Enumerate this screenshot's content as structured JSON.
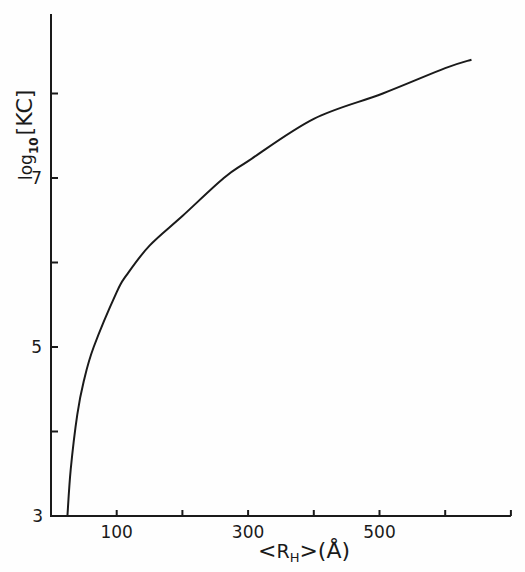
{
  "chart_data": {
    "type": "line",
    "title": "",
    "xlabel": "<R_H> (Å)",
    "ylabel": "log10 [KC]",
    "xlim": [
      0,
      700
    ],
    "ylim": [
      3,
      8.9
    ],
    "grid": false,
    "legend": null,
    "x_ticks": [
      0,
      100,
      200,
      300,
      400,
      500,
      600,
      700
    ],
    "x_tick_labels": [
      "",
      "100",
      "",
      "300",
      "",
      "500",
      "",
      ""
    ],
    "y_ticks": [
      3,
      4,
      5,
      6,
      7,
      8
    ],
    "y_tick_labels": [
      "3",
      "",
      "5",
      "",
      "7",
      ""
    ],
    "series": [
      {
        "name": "log10[KC] vs <R_H>",
        "x": [
          25,
          30,
          40,
          50,
          65,
          100,
          115,
          150,
          200,
          263,
          300,
          400,
          505,
          600,
          640
        ],
        "y": [
          3.0,
          3.55,
          4.2,
          4.6,
          5.0,
          5.65,
          5.85,
          6.2,
          6.55,
          7.0,
          7.2,
          7.7,
          8.0,
          8.3,
          8.4
        ]
      }
    ]
  },
  "labels": {
    "y_axis_main": "log",
    "y_axis_sub": "10",
    "y_axis_bracket": "[KC]",
    "x_axis_lt": "<",
    "x_axis_R": "R",
    "x_axis_sub": "H",
    "x_axis_gt": ">",
    "x_axis_unit": "(Å)"
  },
  "colors": {
    "ink": "#1a1a1a",
    "background": "#fefefe"
  }
}
